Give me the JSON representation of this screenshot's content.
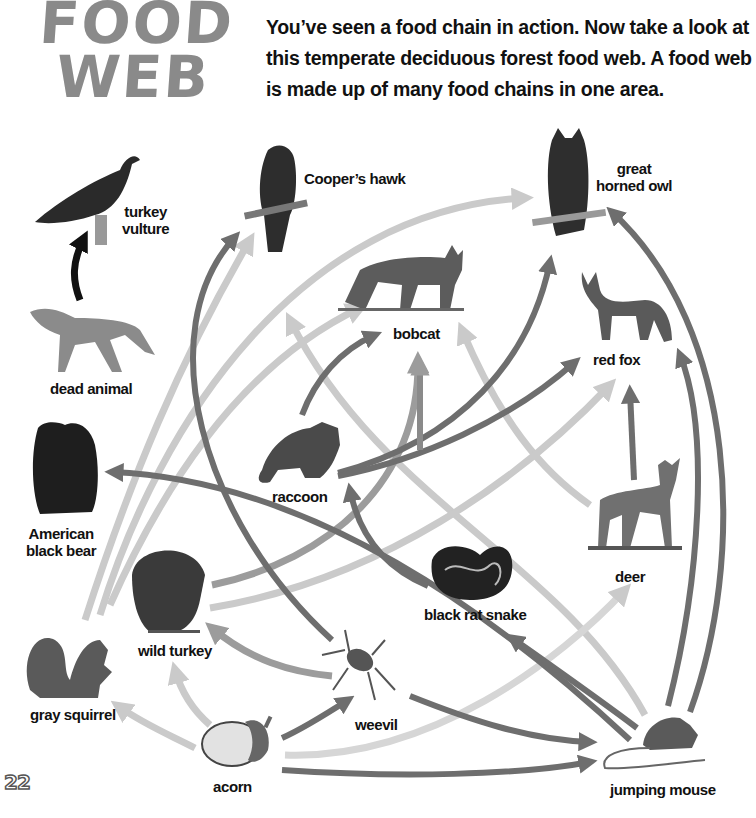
{
  "header": {
    "title_line1": "FOOD",
    "title_line2": "WEB",
    "intro_lines": [
      "You’ve seen a food chain in action. Now take a look at",
      "this temperate deciduous forest food web. A food web",
      "is made up of many food chains in one area."
    ]
  },
  "organisms": {
    "turkey_vulture": {
      "label_line1": "turkey",
      "label_line2": "vulture"
    },
    "dead_animal": {
      "label": "dead animal"
    },
    "coopers_hawk": {
      "label": "Cooper’s hawk"
    },
    "great_horned_owl": {
      "label_line1": "great",
      "label_line2": "horned owl"
    },
    "bobcat": {
      "label": "bobcat"
    },
    "red_fox": {
      "label": "red fox"
    },
    "american_black_bear": {
      "label_line1": "American",
      "label_line2": "black bear"
    },
    "raccoon": {
      "label": "raccoon"
    },
    "deer": {
      "label": "deer"
    },
    "wild_turkey": {
      "label": "wild turkey"
    },
    "black_rat_snake": {
      "label": "black rat snake"
    },
    "gray_squirrel": {
      "label": "gray squirrel"
    },
    "weevil": {
      "label": "weevil"
    },
    "acorn": {
      "label": "acorn"
    },
    "jumping_mouse": {
      "label": "jumping mouse"
    }
  },
  "colors": {
    "dark_arrow": "#6e6e6e",
    "medium_arrow": "#9c9c9c",
    "light_arrow": "#cacaca",
    "black_arrow": "#111111",
    "title_gray": "#8a8a8a"
  },
  "links": [
    {
      "from": "dead animal",
      "to": "turkey vulture",
      "shade": "black"
    },
    {
      "from": "acorn",
      "to": "gray squirrel",
      "shade": "light"
    },
    {
      "from": "acorn",
      "to": "wild turkey",
      "shade": "light"
    },
    {
      "from": "acorn",
      "to": "weevil",
      "shade": "dark"
    },
    {
      "from": "acorn",
      "to": "jumping mouse",
      "shade": "dark"
    },
    {
      "from": "acorn",
      "to": "deer",
      "shade": "light"
    },
    {
      "from": "weevil",
      "to": "wild turkey",
      "shade": "medium"
    },
    {
      "from": "weevil",
      "to": "jumping mouse",
      "shade": "dark"
    },
    {
      "from": "weevil",
      "to": "Cooper’s hawk",
      "shade": "dark"
    },
    {
      "from": "jumping mouse",
      "to": "black rat snake",
      "shade": "dark"
    },
    {
      "from": "jumping mouse",
      "to": "red fox",
      "shade": "dark"
    },
    {
      "from": "jumping mouse",
      "to": "great horned owl",
      "shade": "dark"
    },
    {
      "from": "jumping mouse",
      "to": "American black bear",
      "shade": "dark"
    },
    {
      "from": "jumping mouse",
      "to": "Cooper’s hawk",
      "shade": "light"
    },
    {
      "from": "black rat snake",
      "to": "raccoon",
      "shade": "dark"
    },
    {
      "from": "deer",
      "to": "red fox",
      "shade": "dark"
    },
    {
      "from": "deer",
      "to": "bobcat",
      "shade": "light"
    },
    {
      "from": "raccoon",
      "to": "bobcat",
      "shade": "dark"
    },
    {
      "from": "raccoon",
      "to": "great horned owl",
      "shade": "dark"
    },
    {
      "from": "raccoon",
      "to": "red fox",
      "shade": "dark"
    },
    {
      "from": "wild turkey",
      "to": "bobcat",
      "shade": "medium"
    },
    {
      "from": "wild turkey",
      "to": "red fox",
      "shade": "light"
    },
    {
      "from": "gray squirrel",
      "to": "Cooper’s hawk",
      "shade": "light"
    },
    {
      "from": "gray squirrel",
      "to": "great horned owl",
      "shade": "light"
    },
    {
      "from": "gray squirrel",
      "to": "bobcat",
      "shade": "light"
    },
    {
      "from": "black rat snake",
      "to": "bobcat",
      "shade": "medium"
    }
  ],
  "page": {
    "number": "22"
  }
}
